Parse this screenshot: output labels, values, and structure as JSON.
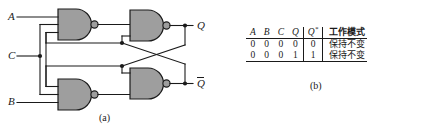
{
  "figure_a": {
    "caption": "(a)",
    "inputs": [
      {
        "name": "A",
        "label": "A",
        "y": 17
      },
      {
        "name": "C",
        "label": "C",
        "y": 56
      },
      {
        "name": "B",
        "label": "B",
        "y": 100
      }
    ],
    "outputs": [
      {
        "name": "Q",
        "label": "Q",
        "overline": false,
        "y": 30
      },
      {
        "name": "Qbar",
        "label": "Q",
        "overline": true,
        "y": 81
      }
    ],
    "gates": [
      {
        "name": "nand-g1",
        "type": "NAND",
        "inputs": 3,
        "position": "top-left"
      },
      {
        "name": "nand-g2",
        "type": "NAND",
        "inputs": 2,
        "position": "top-right"
      },
      {
        "name": "nand-g3",
        "type": "NAND",
        "inputs": 3,
        "position": "bottom-left"
      },
      {
        "name": "nand-g4",
        "type": "NAND",
        "inputs": 2,
        "position": "bottom-right"
      }
    ],
    "gate_fill": "#9e9e9e",
    "line_color": "#1a1a1a"
  },
  "figure_b": {
    "caption": "(b)",
    "table": {
      "headers": [
        "A",
        "B",
        "C",
        "Q",
        "Q*",
        "工作模式"
      ],
      "header_q_next_base": "Q",
      "header_q_next_sup": "*",
      "rows": [
        {
          "A": "0",
          "B": "0",
          "C": "0",
          "Q": "0",
          "Qn": "0",
          "mode": "保持不变"
        },
        {
          "A": "0",
          "B": "0",
          "C": "0",
          "Q": "1",
          "Qn": "1",
          "mode": "保持不变"
        }
      ]
    }
  }
}
